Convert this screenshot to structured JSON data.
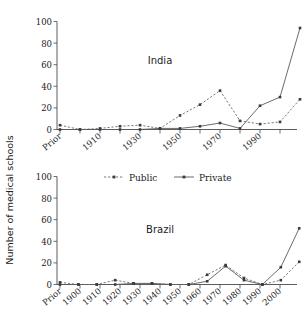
{
  "figure": {
    "ylabel": "Number of medical schools",
    "legend": {
      "position": "between-panels",
      "entries": [
        {
          "label": "Public",
          "style": "dotted",
          "color": "#6a6a6a"
        },
        {
          "label": "Private",
          "style": "solid",
          "color": "#5a5a5a"
        }
      ]
    }
  },
  "chart_data": [
    {
      "type": "line",
      "title": "India",
      "xlabel": "",
      "ylabel": "Number of medical schools",
      "categories": [
        "Prior",
        "1900",
        "1910",
        "1920",
        "1930",
        "1940",
        "1950",
        "1960",
        "1970",
        "1980",
        "1990",
        "2000"
      ],
      "xtick_labels_shown": [
        "Prior",
        "1910",
        "1930",
        "1950",
        "1970",
        "1990"
      ],
      "ylim": [
        0,
        100
      ],
      "yticks": [
        0,
        20,
        40,
        60,
        80,
        100
      ],
      "grid": false,
      "series": [
        {
          "name": "Public",
          "values": [
            4,
            0,
            1,
            3,
            4,
            1,
            13,
            23,
            36,
            8,
            5,
            7,
            28
          ]
        },
        {
          "name": "Private",
          "values": [
            0,
            0,
            0,
            0,
            0,
            1,
            1,
            3,
            6,
            1,
            22,
            30,
            94
          ]
        }
      ]
    },
    {
      "type": "line",
      "title": "Brazil",
      "xlabel": "",
      "ylabel": "Number of medical schools",
      "categories": [
        "Prior",
        "1900",
        "1910",
        "1920",
        "1930",
        "1940",
        "1950",
        "1960",
        "1970",
        "1980",
        "1990",
        "2000"
      ],
      "xtick_labels_shown": [
        "Prior",
        "1900",
        "1910",
        "1920",
        "1930",
        "1940",
        "1950",
        "1960",
        "1970",
        "1980",
        "1990",
        "2000"
      ],
      "ylim": [
        0,
        100
      ],
      "yticks": [
        0,
        20,
        40,
        60,
        80,
        100
      ],
      "grid": false,
      "series": [
        {
          "name": "Public",
          "values": [
            2,
            0,
            0,
            4,
            1,
            1,
            0,
            0,
            9,
            18,
            6,
            0,
            4,
            21
          ]
        },
        {
          "name": "Private",
          "values": [
            0,
            0,
            0,
            0,
            1,
            1,
            0,
            0,
            3,
            17,
            4,
            0,
            16,
            52
          ]
        }
      ]
    }
  ]
}
